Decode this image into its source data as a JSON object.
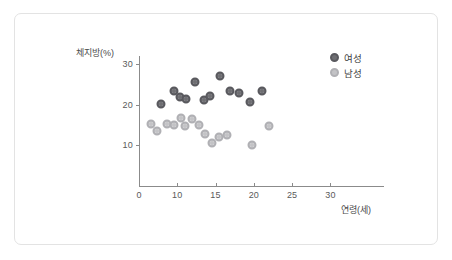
{
  "chart_data": {
    "type": "scatter",
    "title": "",
    "xlabel": "연령(세)",
    "ylabel": "체지방(%)",
    "xlim": [
      0,
      32
    ],
    "ylim": [
      0,
      32
    ],
    "grid": false,
    "legend_position": "top-right",
    "x_ticks": [
      {
        "value": 0,
        "label": "0"
      },
      {
        "value": 5,
        "label": "10"
      },
      {
        "value": 10,
        "label": "15"
      },
      {
        "value": 15,
        "label": "20"
      },
      {
        "value": 20,
        "label": "25"
      },
      {
        "value": 25,
        "label": "30"
      }
    ],
    "y_ticks": [
      {
        "value": 10,
        "label": "10"
      },
      {
        "value": 20,
        "label": "20"
      },
      {
        "value": 30,
        "label": "30"
      }
    ],
    "series": [
      {
        "name": "여성",
        "color": "#6e6e72",
        "marker": "circle-dark",
        "points": [
          {
            "x": 2.9,
            "y": 20.3
          },
          {
            "x": 4.6,
            "y": 23.5
          },
          {
            "x": 5.3,
            "y": 22.0
          },
          {
            "x": 6.1,
            "y": 21.4
          },
          {
            "x": 7.3,
            "y": 25.7
          },
          {
            "x": 8.5,
            "y": 21.1
          },
          {
            "x": 9.3,
            "y": 22.2
          },
          {
            "x": 10.6,
            "y": 27.0
          },
          {
            "x": 11.9,
            "y": 23.5
          },
          {
            "x": 13.1,
            "y": 22.9
          },
          {
            "x": 14.5,
            "y": 20.8
          },
          {
            "x": 16.0,
            "y": 23.4
          }
        ]
      },
      {
        "name": "남성",
        "color": "#c3c3c6",
        "marker": "circle-light",
        "points": [
          {
            "x": 1.6,
            "y": 15.2
          },
          {
            "x": 2.4,
            "y": 13.5
          },
          {
            "x": 3.6,
            "y": 15.2
          },
          {
            "x": 4.6,
            "y": 15.1
          },
          {
            "x": 5.5,
            "y": 16.8
          },
          {
            "x": 6.0,
            "y": 14.7
          },
          {
            "x": 6.9,
            "y": 16.6
          },
          {
            "x": 7.8,
            "y": 15.1
          },
          {
            "x": 8.6,
            "y": 12.7
          },
          {
            "x": 9.5,
            "y": 10.6
          },
          {
            "x": 10.4,
            "y": 12.1
          },
          {
            "x": 11.5,
            "y": 12.6
          },
          {
            "x": 14.8,
            "y": 10.0
          },
          {
            "x": 17.0,
            "y": 14.8
          }
        ]
      }
    ]
  },
  "legend": {
    "items": [
      {
        "label": "여성",
        "series": "female"
      },
      {
        "label": "남성",
        "series": "male"
      }
    ]
  }
}
